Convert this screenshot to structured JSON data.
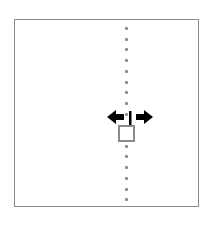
{
  "canvas": {
    "background": "#ffffff",
    "frame_border_color": "#8a8a8a"
  },
  "guide_line": {
    "style": "dotted-vertical",
    "color": "#8c8c8c",
    "dot_count": 17
  },
  "cursor": {
    "icon": "resize-horizontal-cursor-icon",
    "color": "#000000"
  },
  "handle": {
    "icon": "square-handle-icon",
    "border_color": "#8a8a8a"
  }
}
